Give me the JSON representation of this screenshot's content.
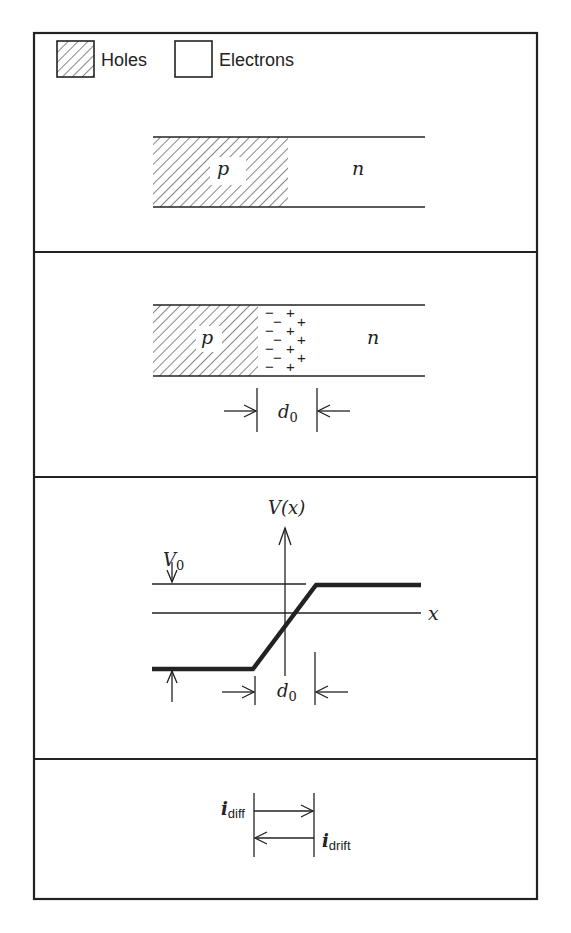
{
  "legend": {
    "holes_label": "Holes",
    "electrons_label": "Electrons"
  },
  "panel1": {
    "p_label": "p",
    "n_label": "n"
  },
  "panel2": {
    "p_label": "p",
    "n_label": "n",
    "depletion_width_label": "d",
    "depletion_width_sub": "0",
    "negative_charges": [
      "−",
      "−",
      "−",
      "−",
      "−",
      "−",
      "−"
    ],
    "positive_charges": [
      "+",
      "+",
      "+",
      "+",
      "+",
      "+",
      "+"
    ]
  },
  "panel3": {
    "y_axis_label": "V(x)",
    "x_axis_label": "x",
    "potential_label": "V",
    "potential_sub": "0",
    "width_label": "d",
    "width_sub": "0"
  },
  "panel4": {
    "diff_current_label": "i",
    "diff_current_sub": "diff",
    "drift_current_label": "i",
    "drift_current_sub": "drift"
  },
  "colors": {
    "ink": "#222222",
    "background": "#ffffff"
  }
}
